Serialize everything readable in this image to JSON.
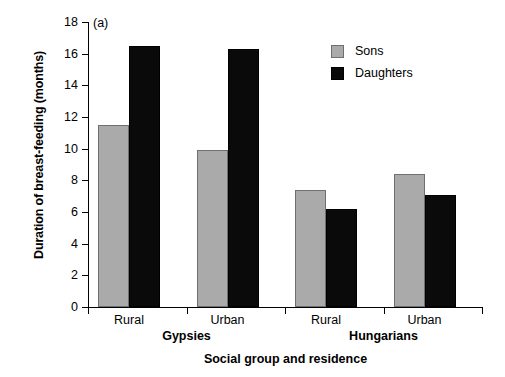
{
  "chart_data": {
    "type": "bar",
    "title": "",
    "panel_label": "(a)",
    "xlabel": "Social group and residence",
    "ylabel": "Duration of breast-feeding (months)",
    "ylim": [
      0,
      18
    ],
    "ytick_step": 2,
    "yticks": [
      "18",
      "16",
      "14",
      "12",
      "10",
      "8",
      "6",
      "4",
      "2",
      "0"
    ],
    "grid": false,
    "legend_position": "top-right",
    "categories": [
      "Rural",
      "Urban",
      "Rural",
      "Urban"
    ],
    "group_labels": [
      "Gypsies",
      "Hungarians"
    ],
    "series": [
      {
        "name": "Sons",
        "color": "#aaaaaa",
        "values": [
          11.5,
          9.9,
          7.4,
          8.4
        ]
      },
      {
        "name": "Daughters",
        "color": "#0a0a0a",
        "values": [
          16.5,
          16.3,
          6.2,
          7.1
        ]
      }
    ]
  },
  "axis": {
    "y_title": "Duration of breast-feeding (months)",
    "x_title": "Social group and residence",
    "y_labels": [
      "18",
      "16",
      "14",
      "12",
      "10",
      "8",
      "6",
      "4",
      "2",
      "0"
    ]
  },
  "legend": {
    "items": [
      {
        "label": "Sons"
      },
      {
        "label": "Daughters"
      }
    ]
  },
  "x_axis": {
    "sub_labels": [
      "Rural",
      "Urban",
      "Rural",
      "Urban"
    ],
    "groups": [
      "Gypsies",
      "Hungarians"
    ]
  },
  "panel": {
    "label": "(a)"
  }
}
